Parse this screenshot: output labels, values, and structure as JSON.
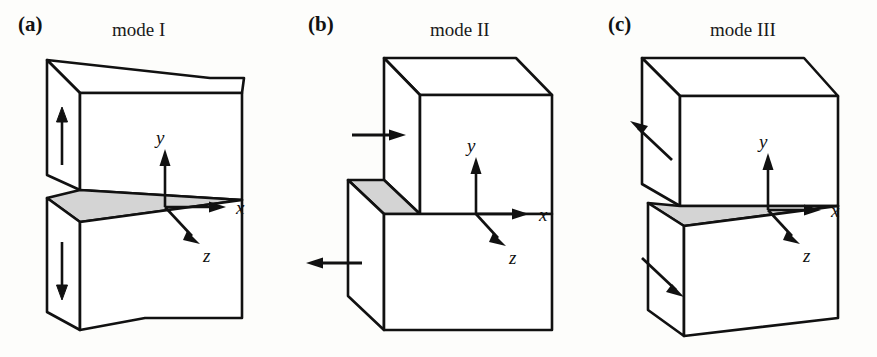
{
  "figure": {
    "caption_type": "fracture-modes-diagram",
    "background_color": "#fdfdfb",
    "line_color": "#111111",
    "crack_face_color": "#d4d4d4",
    "panels": [
      {
        "id": "a",
        "label": "(a)",
        "title": "mode I",
        "description": "opening mode",
        "axes": {
          "x": "x",
          "y": "y",
          "z": "z"
        },
        "load_arrows": [
          {
            "name": "upper-load-arrow",
            "direction": "up"
          },
          {
            "name": "lower-load-arrow",
            "direction": "down"
          }
        ]
      },
      {
        "id": "b",
        "label": "(b)",
        "title": "mode II",
        "description": "in-plane sliding mode",
        "axes": {
          "x": "x",
          "y": "y",
          "z": "z"
        },
        "load_arrows": [
          {
            "name": "upper-load-arrow",
            "direction": "right"
          },
          {
            "name": "lower-load-arrow",
            "direction": "left"
          }
        ]
      },
      {
        "id": "c",
        "label": "(c)",
        "title": "mode III",
        "description": "anti-plane tearing mode",
        "axes": {
          "x": "x",
          "y": "y",
          "z": "z"
        },
        "load_arrows": [
          {
            "name": "upper-load-arrow",
            "direction": "up-left"
          },
          {
            "name": "lower-load-arrow",
            "direction": "down-right"
          }
        ]
      }
    ]
  }
}
